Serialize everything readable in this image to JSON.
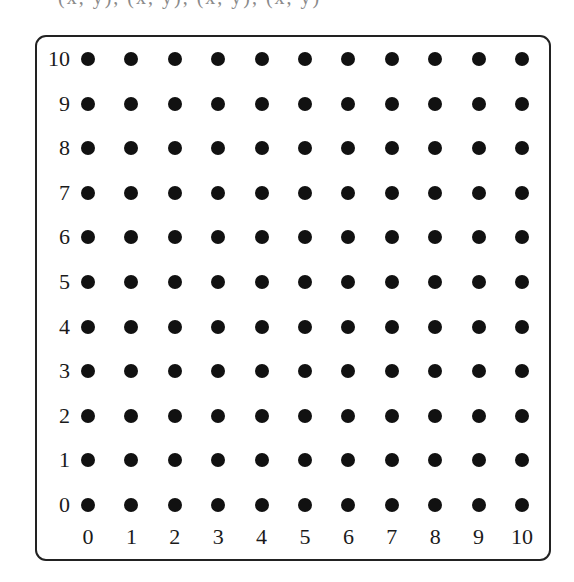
{
  "caption": "(x, y), (x, y), (x, y), (x, y)",
  "grid": {
    "x_min": 0,
    "x_max": 10,
    "y_min": 0,
    "y_max": 10,
    "x_tick_labels": [
      "0",
      "1",
      "2",
      "3",
      "4",
      "5",
      "6",
      "7",
      "8",
      "9",
      "10"
    ],
    "y_tick_labels": [
      "0",
      "1",
      "2",
      "3",
      "4",
      "5",
      "6",
      "7",
      "8",
      "9",
      "10"
    ],
    "dot_color": "#111111",
    "frame_color": "#222222"
  },
  "layout": {
    "origin_px": [
      88,
      505
    ],
    "col_spacing_px": 43.4,
    "row_spacing_px": 44.6,
    "y_label_right_px": 70,
    "x_label_center_y_px": 537
  }
}
